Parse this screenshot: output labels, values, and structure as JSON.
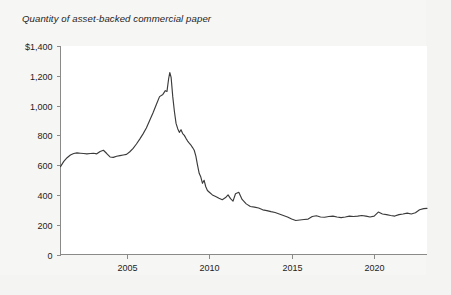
{
  "figure": {
    "title": "Quantity of asset-backed commercial paper",
    "background_color": "#f6f6f5",
    "plot_background_color": "#ffffff",
    "line_color": "#3b3b3b",
    "axis_color": "#8a8a88",
    "text_color": "#1d1d1b"
  },
  "chart_data": {
    "type": "line",
    "title": "Quantity of asset-backed commercial paper",
    "xlabel": "",
    "ylabel": "",
    "ylim": [
      0,
      1400
    ],
    "xlim": [
      2001.0,
      2023.2
    ],
    "grid": false,
    "legend": null,
    "y_ticks": [
      0,
      200,
      400,
      600,
      800,
      1000,
      1200,
      1400
    ],
    "y_tick_labels": [
      "0",
      "200",
      "400",
      "600",
      "800",
      "1,000",
      "1,200",
      "$1,400"
    ],
    "x_ticks": [
      2005,
      2010,
      2015,
      2020
    ],
    "x_tick_labels": [
      "2005",
      "2010",
      "2015",
      "2020"
    ],
    "units": "billions of US dollars",
    "series": [
      {
        "name": "Asset-backed commercial paper outstanding",
        "x": [
          2001.0,
          2001.2,
          2001.4,
          2001.6,
          2001.8,
          2002.0,
          2002.2,
          2002.4,
          2002.6,
          2002.8,
          2003.0,
          2003.2,
          2003.4,
          2003.6,
          2003.8,
          2004.0,
          2004.2,
          2004.4,
          2004.6,
          2004.8,
          2005.0,
          2005.2,
          2005.4,
          2005.6,
          2005.8,
          2006.0,
          2006.2,
          2006.4,
          2006.6,
          2006.8,
          2007.0,
          2007.2,
          2007.35,
          2007.45,
          2007.55,
          2007.62,
          2007.7,
          2007.8,
          2007.9,
          2008.0,
          2008.1,
          2008.2,
          2008.3,
          2008.4,
          2008.5,
          2008.6,
          2008.7,
          2008.8,
          2008.9,
          2009.0,
          2009.1,
          2009.2,
          2009.3,
          2009.4,
          2009.5,
          2009.6,
          2009.7,
          2009.8,
          2009.9,
          2010.0,
          2010.2,
          2010.4,
          2010.6,
          2010.8,
          2011.0,
          2011.15,
          2011.3,
          2011.45,
          2011.6,
          2011.8,
          2012.0,
          2012.25,
          2012.5,
          2012.75,
          2013.0,
          2013.25,
          2013.5,
          2013.75,
          2014.0,
          2014.25,
          2014.5,
          2014.75,
          2015.0,
          2015.25,
          2015.5,
          2015.75,
          2016.0,
          2016.25,
          2016.5,
          2016.75,
          2017.0,
          2017.25,
          2017.5,
          2017.75,
          2018.0,
          2018.25,
          2018.5,
          2018.75,
          2019.0,
          2019.25,
          2019.5,
          2019.75,
          2020.0,
          2020.25,
          2020.5,
          2020.75,
          2021.0,
          2021.25,
          2021.5,
          2021.75,
          2022.0,
          2022.25,
          2022.5,
          2022.75,
          2023.0,
          2023.2
        ],
        "y": [
          590,
          625,
          650,
          668,
          678,
          682,
          680,
          678,
          676,
          678,
          680,
          676,
          692,
          700,
          678,
          655,
          652,
          660,
          664,
          668,
          672,
          690,
          712,
          742,
          775,
          810,
          850,
          900,
          950,
          1005,
          1060,
          1075,
          1100,
          1095,
          1180,
          1222,
          1190,
          1060,
          960,
          880,
          845,
          820,
          838,
          812,
          800,
          780,
          762,
          748,
          735,
          718,
          700,
          660,
          600,
          545,
          520,
          478,
          498,
          455,
          430,
          420,
          400,
          390,
          378,
          368,
          382,
          400,
          375,
          358,
          408,
          418,
          370,
          340,
          322,
          318,
          312,
          300,
          295,
          288,
          282,
          272,
          262,
          252,
          238,
          228,
          232,
          235,
          238,
          255,
          260,
          252,
          250,
          255,
          258,
          252,
          248,
          252,
          258,
          255,
          258,
          262,
          258,
          252,
          258,
          285,
          272,
          268,
          262,
          258,
          268,
          272,
          278,
          272,
          280,
          300,
          308,
          310
        ]
      }
    ]
  }
}
